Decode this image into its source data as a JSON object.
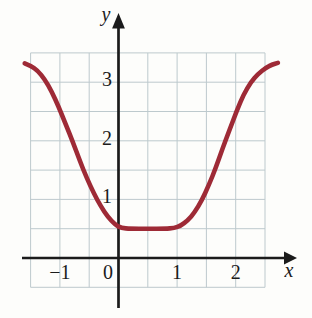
{
  "figure": {
    "background": "#fdfdfb",
    "grid_color": "#bdc9cd",
    "axis_color": "#1b1b1b",
    "text_color": "#1b1b1b",
    "curve_color": "#9e2a36"
  },
  "chart_data": {
    "type": "line",
    "title": "",
    "xlabel": "x",
    "ylabel": "y",
    "xlim": [
      -1.6,
      2.75
    ],
    "ylim": [
      -0.55,
      3.6
    ],
    "grid": {
      "on": true,
      "step": 0.5,
      "xmin": -1.5,
      "xmax": 2.5,
      "ymin": -0.5,
      "ymax": 3.5
    },
    "x_ticks": [
      {
        "value": -1,
        "label": "−1"
      },
      {
        "value": 0,
        "label": "0"
      },
      {
        "value": 1,
        "label": "1"
      },
      {
        "value": 2,
        "label": "2"
      }
    ],
    "y_ticks": [
      {
        "value": 1,
        "label": "1"
      },
      {
        "value": 2,
        "label": "2"
      },
      {
        "value": 3,
        "label": "3"
      }
    ],
    "series": [
      {
        "name": "curve",
        "color": "#9e2a36",
        "flat_segment": {
          "x_from": 0,
          "x_to": 1,
          "y": 0.5
        },
        "points": [
          [
            -1.6,
            3.32
          ],
          [
            -1.5,
            3.28
          ],
          [
            -1.38,
            3.2
          ],
          [
            -1.26,
            3.05
          ],
          [
            -1.14,
            2.84
          ],
          [
            -1.02,
            2.58
          ],
          [
            -0.9,
            2.28
          ],
          [
            -0.78,
            1.98
          ],
          [
            -0.66,
            1.66
          ],
          [
            -0.54,
            1.36
          ],
          [
            -0.42,
            1.1
          ],
          [
            -0.3,
            0.88
          ],
          [
            -0.18,
            0.7
          ],
          [
            -0.06,
            0.57
          ],
          [
            0.05,
            0.51
          ],
          [
            0.2,
            0.5
          ],
          [
            0.5,
            0.5
          ],
          [
            0.8,
            0.5
          ],
          [
            0.95,
            0.51
          ],
          [
            1.06,
            0.55
          ],
          [
            1.18,
            0.64
          ],
          [
            1.3,
            0.78
          ],
          [
            1.42,
            0.98
          ],
          [
            1.54,
            1.24
          ],
          [
            1.66,
            1.54
          ],
          [
            1.78,
            1.88
          ],
          [
            1.9,
            2.2
          ],
          [
            2.02,
            2.52
          ],
          [
            2.14,
            2.8
          ],
          [
            2.26,
            3.0
          ],
          [
            2.38,
            3.14
          ],
          [
            2.52,
            3.25
          ],
          [
            2.62,
            3.3
          ],
          [
            2.72,
            3.33
          ]
        ]
      }
    ]
  }
}
